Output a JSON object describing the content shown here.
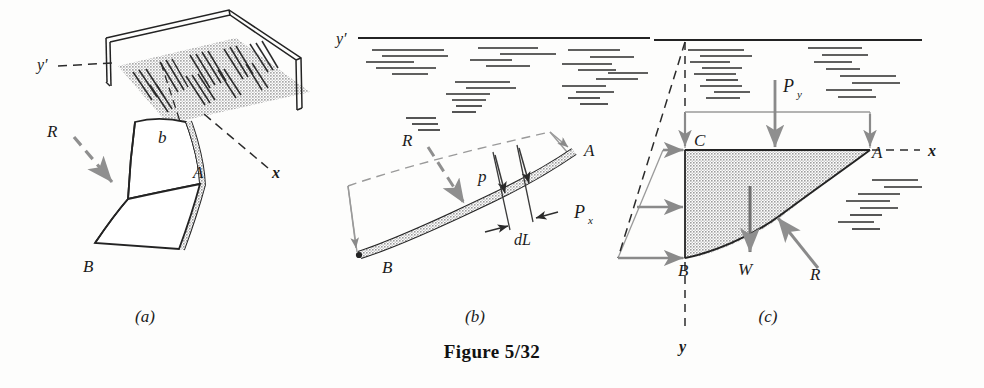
{
  "figure": {
    "caption": "Figure 5/32",
    "panels": [
      {
        "id": "a",
        "label": "(a)",
        "description": "Pictorial view of tank with curved submerged surface AB of width b",
        "labels": {
          "y_axis": "y′",
          "x_axis": "x",
          "resultant": "R",
          "width": "b",
          "point_top": "A",
          "point_bottom": "B"
        }
      },
      {
        "id": "b",
        "label": "(b)",
        "description": "Side view showing pressure p acting normal to elemental length dL of surface AB",
        "labels": {
          "y_axis": "y′",
          "resultant": "R",
          "pressure": "p",
          "element": "dL",
          "point_top": "A",
          "point_bottom": "B"
        }
      },
      {
        "id": "c",
        "label": "(c)",
        "description": "Free-body diagram of liquid block ABC with forces Px, Py, W and reaction R",
        "labels": {
          "x_axis": "x",
          "y_axis": "y",
          "horizontal_force": "P",
          "horizontal_force_sub": "x",
          "vertical_force": "P",
          "vertical_force_sub": "y",
          "weight": "W",
          "resultant": "R",
          "point_a": "A",
          "point_b": "B",
          "point_c": "C"
        }
      }
    ]
  },
  "colors": {
    "ink": "#1b1b1b",
    "line": "#222222",
    "gray_arrow": "#8a8a8a",
    "thin_gray": "#9a9a9a",
    "shade_fill": "#b9b9b9",
    "surface_shade": "#bdbdbd",
    "paper": "#fdfdfc"
  }
}
